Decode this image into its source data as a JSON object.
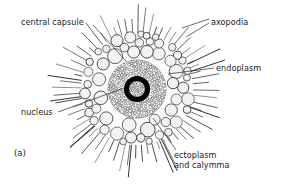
{
  "figure": {
    "caption_letter": "(a)",
    "background_color": "#ffffff",
    "ink_color": "#1a1a1a",
    "nucleus_color": "#000000",
    "vacuole_fill": "#f2f2f2",
    "stipple_color": "#2b2b2b"
  },
  "labels": {
    "central_capsule": "central capsule",
    "axopodia": "axopodia",
    "endoplasm": "endoplasm",
    "nucleus": "nucleus",
    "ectoplasm_line1": "ectoplasm",
    "ectoplasm_line2": "and calymma"
  },
  "geometry": {
    "center_x": 137,
    "center_y": 89,
    "nucleus_outer_radius": 13,
    "nucleus_inner_radius": 8,
    "endoplasm_radius": 29,
    "vacuole_zone_radius": 56,
    "axopodia_outer_radius": 86,
    "axopodia_count": 64
  },
  "leaders": [
    {
      "name": "central-capsule-leader",
      "x1": 93,
      "y1": 25,
      "x2": 126,
      "y2": 61
    },
    {
      "name": "axopodia-leader-upper",
      "x1": 209,
      "y1": 19,
      "x2": 182,
      "y2": 28
    },
    {
      "name": "axopodia-leader-lower",
      "x1": 209,
      "y1": 23,
      "x2": 186,
      "y2": 37
    },
    {
      "name": "endoplasm-leader",
      "x1": 214,
      "y1": 68,
      "x2": 168,
      "y2": 74
    },
    {
      "name": "nucleus-leader",
      "x1": 58,
      "y1": 112,
      "x2": 124,
      "y2": 88
    },
    {
      "name": "ectoplasm-leader",
      "x1": 176,
      "y1": 150,
      "x2": 153,
      "y2": 118
    }
  ]
}
